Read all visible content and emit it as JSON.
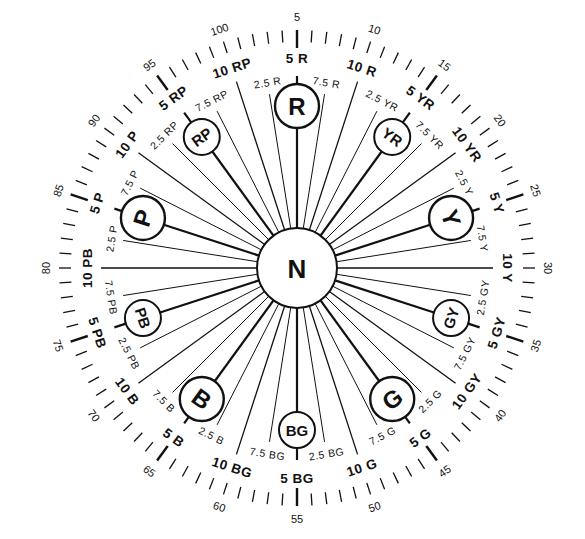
{
  "diagram": {
    "center": {
      "label": "N"
    },
    "principal_hues": [
      {
        "label": "R",
        "hue": 5,
        "family": "R",
        "size": "large"
      },
      {
        "label": "YR",
        "hue": 15,
        "family": "YR",
        "size": "small"
      },
      {
        "label": "Y",
        "hue": 25,
        "family": "Y",
        "size": "large"
      },
      {
        "label": "GY",
        "hue": 35,
        "family": "GY",
        "size": "small"
      },
      {
        "label": "G",
        "hue": 45,
        "family": "G",
        "size": "large"
      },
      {
        "label": "BG",
        "hue": 55,
        "family": "BG",
        "size": "small"
      },
      {
        "label": "B",
        "hue": 65,
        "family": "B",
        "size": "large"
      },
      {
        "label": "PB",
        "hue": 75,
        "family": "PB",
        "size": "small"
      },
      {
        "label": "P",
        "hue": 85,
        "family": "P",
        "size": "large"
      },
      {
        "label": "RP",
        "hue": 95,
        "family": "RP",
        "size": "small"
      }
    ],
    "hue_labels": [
      "5 R",
      "7.5 R",
      "10 R",
      "2.5 YR",
      "5 YR",
      "7.5 YR",
      "10 YR",
      "2.5 Y",
      "5 Y",
      "7.5 Y",
      "10 Y",
      "2.5 GY",
      "5 GY",
      "7.5 GY",
      "10 GY",
      "2.5 G",
      "5 G",
      "7.5 G",
      "10 G",
      "2.5 BG",
      "5 BG",
      "7.5 BG",
      "10 BG",
      "2.5 B",
      "5 B",
      "7.5 B",
      "10 B",
      "2.5 PB",
      "5 PB",
      "7.5 PB",
      "10 PB",
      "2.5 P",
      "5 P",
      "7.5 P",
      "10 P",
      "2.5 RP",
      "5 RP",
      "7.5 RP",
      "10 RP",
      "2.5 R"
    ],
    "scale_numbers": [
      "5",
      "10",
      "15",
      "20",
      "25",
      "30",
      "35",
      "40",
      "45",
      "50",
      "55",
      "60",
      "65",
      "70",
      "75",
      "80",
      "85",
      "90",
      "95",
      "100"
    ],
    "tick_count": 100,
    "colors": {
      "ink": "#111111",
      "background": "#ffffff"
    }
  }
}
